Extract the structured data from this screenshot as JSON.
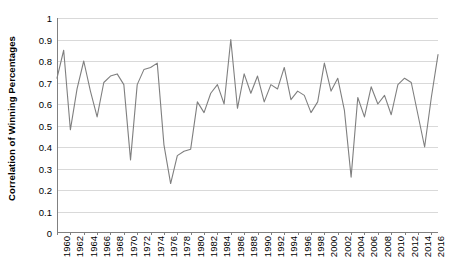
{
  "chart_data": {
    "type": "line",
    "title": "",
    "xlabel": "",
    "ylabel": "Correlation of Winning Percentages",
    "ylim": [
      0,
      1
    ],
    "ytick_values": [
      0,
      0.1,
      0.2,
      0.3,
      0.4,
      0.5,
      0.6,
      0.7,
      0.8,
      0.9,
      1
    ],
    "ytick_labels": [
      "0",
      "0.1",
      "0.2",
      "0.3",
      "0.4",
      "0.5",
      "0.6",
      "0.7",
      "0.8",
      "0.9",
      "1"
    ],
    "xlim": [
      1960,
      2017
    ],
    "xtick_labels": [
      "1960",
      "1962",
      "1964",
      "1966",
      "1968",
      "1970",
      "1972",
      "1974",
      "1976",
      "1978",
      "1980",
      "1982",
      "1984",
      "1986",
      "1988",
      "1990",
      "1992",
      "1994",
      "1996",
      "1998",
      "2000",
      "2002",
      "2004",
      "2006",
      "2008",
      "2010",
      "2012",
      "2014",
      "2016"
    ],
    "xtick_values": [
      1960,
      1962,
      1964,
      1966,
      1968,
      1970,
      1972,
      1974,
      1976,
      1978,
      1980,
      1982,
      1984,
      1986,
      1988,
      1990,
      1992,
      1994,
      1996,
      1998,
      2000,
      2002,
      2004,
      2006,
      2008,
      2010,
      2012,
      2014,
      2016
    ],
    "grid": true,
    "grid_axis": "y",
    "legend": false,
    "line_color": "#7f7f7f",
    "line_width": 1.1,
    "x": [
      1960,
      1961,
      1962,
      1963,
      1964,
      1965,
      1966,
      1967,
      1968,
      1969,
      1970,
      1971,
      1972,
      1973,
      1974,
      1975,
      1976,
      1977,
      1978,
      1979,
      1980,
      1981,
      1982,
      1983,
      1984,
      1985,
      1986,
      1987,
      1988,
      1989,
      1990,
      1991,
      1992,
      1993,
      1994,
      1995,
      1996,
      1997,
      1998,
      1999,
      2000,
      2001,
      2002,
      2003,
      2004,
      2005,
      2006,
      2007,
      2008,
      2009,
      2010,
      2011,
      2012,
      2013,
      2014,
      2015,
      2016,
      2017
    ],
    "y": [
      0.72,
      0.85,
      0.48,
      0.67,
      0.8,
      0.66,
      0.54,
      0.7,
      0.73,
      0.74,
      0.69,
      0.34,
      0.69,
      0.76,
      0.77,
      0.79,
      0.41,
      0.23,
      0.36,
      0.38,
      0.39,
      0.61,
      0.56,
      0.65,
      0.69,
      0.6,
      0.9,
      0.58,
      0.74,
      0.65,
      0.73,
      0.61,
      0.69,
      0.67,
      0.77,
      0.62,
      0.66,
      0.64,
      0.56,
      0.61,
      0.79,
      0.66,
      0.72,
      0.57,
      0.26,
      0.63,
      0.54,
      0.68,
      0.6,
      0.64,
      0.55,
      0.69,
      0.72,
      0.7,
      0.55,
      0.4,
      0.63,
      0.83
    ]
  }
}
